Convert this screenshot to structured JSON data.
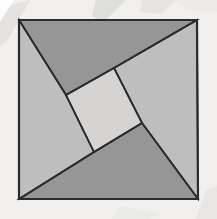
{
  "figure": {
    "canvas": {
      "width": 217,
      "height": 219
    },
    "background": {
      "color": "#f1f0ee",
      "watermark_streaks": [
        {
          "name": "streak-upper-left",
          "color": "#e3e2e0"
        },
        {
          "name": "streak-upper-right",
          "color": "#dedddb"
        },
        {
          "name": "streak-lower-right",
          "color": "#e6e5e3"
        }
      ]
    },
    "outline": {
      "name": "outer-square",
      "points": "19,20 197,20 198,199 19,199",
      "stroke": "#2b2b2b",
      "stroke_width": 2.2,
      "fill": "#bebebe"
    },
    "pieces": [
      {
        "name": "triangle-top",
        "label": "Top triangle",
        "points": "19,20 197,20 114,68 66,95",
        "fill": "#969696",
        "stroke": "#2b2b2b"
      },
      {
        "name": "triangle-right",
        "label": "Right triangle",
        "points": "197,20 198,199 142,123 114,68",
        "fill": "#bebebe",
        "stroke": "#2b2b2b"
      },
      {
        "name": "triangle-bottom",
        "label": "Bottom triangle",
        "points": "198,199 19,199 94,152 142,123",
        "fill": "#969696",
        "stroke": "#2b2b2b"
      },
      {
        "name": "triangle-left",
        "label": "Left triangle",
        "points": "19,199 19,20 66,95 94,152",
        "fill": "#bebebe",
        "stroke": "#2b2b2b"
      },
      {
        "name": "inner-square",
        "label": "Central tilted square",
        "points": "114,68 142,123 94,152 66,95",
        "fill": "#d5d4d2",
        "stroke": "#2b2b2b"
      }
    ],
    "cut_lines": [
      {
        "name": "cut-top-left",
        "x1": 19,
        "y1": 20,
        "x2": 66,
        "y2": 95
      },
      {
        "name": "cut-top-right",
        "x1": 197,
        "y1": 20,
        "x2": 114,
        "y2": 68
      },
      {
        "name": "cut-bottom-right",
        "x1": 198,
        "y1": 199,
        "x2": 142,
        "y2": 123
      },
      {
        "name": "cut-bottom-left",
        "x1": 19,
        "y1": 199,
        "x2": 94,
        "y2": 152
      },
      {
        "name": "inner-edge-top-left",
        "x1": 66,
        "y1": 95,
        "x2": 114,
        "y2": 68
      },
      {
        "name": "inner-edge-top-right",
        "x1": 114,
        "y1": 68,
        "x2": 142,
        "y2": 123
      },
      {
        "name": "inner-edge-bottom-right",
        "x1": 142,
        "y1": 123,
        "x2": 94,
        "y2": 152
      },
      {
        "name": "inner-edge-bottom-left",
        "x1": 94,
        "y1": 152,
        "x2": 66,
        "y2": 95
      }
    ],
    "colors": {
      "dark_gray": "#969696",
      "mid_gray": "#bebebe",
      "light_gray": "#d5d4d2",
      "line": "#2b2b2b",
      "background": "#f1f0ee"
    }
  }
}
